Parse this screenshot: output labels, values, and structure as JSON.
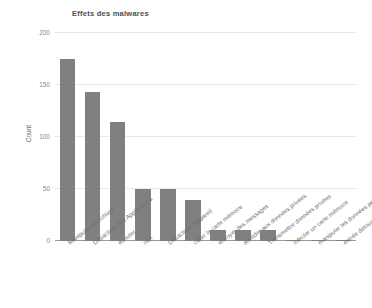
{
  "chart_data": {
    "type": "bar",
    "title": "Effets des malwares",
    "xlabel": "",
    "ylabel": "Count",
    "ylim": [
      0,
      200
    ],
    "yticks": [
      0,
      50,
      100,
      150,
      200
    ],
    "grid": true,
    "legend": false,
    "bar_color": "#808080",
    "categories": [
      "Manipuler les fichiers",
      "Désactiver des Applications",
      "écouter",
      "rien",
      "Désactiver l'appareil",
      "cibler la carte mémoire",
      "envoyer des messages",
      "accéder aux données privées",
      "Transmettre données privées",
      "infecter un carte mémoire",
      "manipuler les données perso",
      "entrée détournée"
    ],
    "values": [
      175,
      143,
      114,
      50,
      50,
      39,
      11,
      11,
      11,
      1,
      1,
      1
    ]
  }
}
